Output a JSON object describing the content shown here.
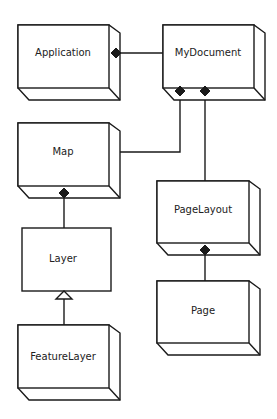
{
  "diagram": {
    "type": "UML class diagram",
    "classes": [
      {
        "id": "application",
        "label": "Application"
      },
      {
        "id": "mydocument",
        "label": "MyDocument"
      },
      {
        "id": "map",
        "label": "Map"
      },
      {
        "id": "pagelayout",
        "label": "PageLayout"
      },
      {
        "id": "layer",
        "label": "Layer"
      },
      {
        "id": "page",
        "label": "Page"
      },
      {
        "id": "featurelayer",
        "label": "FeatureLayer"
      }
    ],
    "relationships": [
      {
        "from": "application",
        "to": "mydocument",
        "type": "composition",
        "diamond_at": "application"
      },
      {
        "from": "mydocument",
        "to": "map",
        "type": "composition",
        "diamond_at": "mydocument"
      },
      {
        "from": "mydocument",
        "to": "pagelayout",
        "type": "composition",
        "diamond_at": "mydocument"
      },
      {
        "from": "map",
        "to": "layer",
        "type": "composition",
        "diamond_at": "map"
      },
      {
        "from": "pagelayout",
        "to": "page",
        "type": "composition",
        "diamond_at": "pagelayout"
      },
      {
        "from": "featurelayer",
        "to": "layer",
        "type": "inheritance",
        "triangle_at": "layer"
      }
    ]
  }
}
